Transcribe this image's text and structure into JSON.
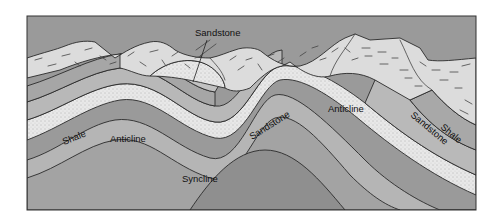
{
  "figure": {
    "type": "geologic cross-section",
    "labels": {
      "sandstone_top": "Sandstone",
      "shale_left": "Shale",
      "anticline_left": "Anticline",
      "syncline": "Syncline",
      "sandstone_middle": "Sandstone",
      "anticline_right": "Anticline",
      "sandstone_right": "Sandstone",
      "shale_right": "Shale"
    },
    "colors": {
      "background": "#ffffff",
      "cover_rock": "#dcdcdc",
      "layer_light": "#c4c4c4",
      "layer_mid": "#adadad",
      "layer_dark": "#979797",
      "sandstone": "#e6e6e6",
      "outline": "#2a2a2a"
    }
  }
}
